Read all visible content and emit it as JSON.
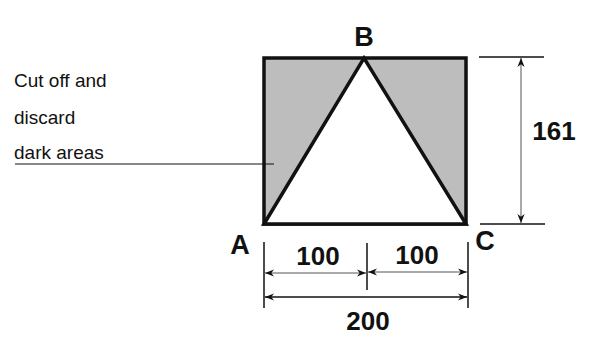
{
  "diagram": {
    "annotation": {
      "lines": [
        "Cut off and",
        "discard",
        "dark areas"
      ]
    },
    "vertices": {
      "a": "A",
      "b": "B",
      "c": "C"
    },
    "dimensions": {
      "half_left": "100",
      "half_right": "100",
      "base": "200",
      "height": "161"
    },
    "colors": {
      "shaded": "#bdbdbd",
      "stroke": "#111111",
      "background": "#ffffff"
    }
  }
}
